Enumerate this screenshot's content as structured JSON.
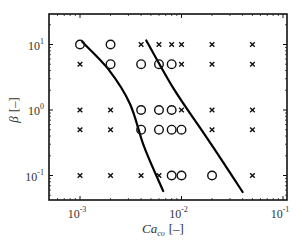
{
  "chart_data": {
    "type": "scatter",
    "title": "",
    "xlabel": "Ca_co [-]",
    "xlabel_main": "Ca",
    "xlabel_sub": "co",
    "xlabel_unit": "[–]",
    "ylabel": "β [-]",
    "ylabel_symbol": "β",
    "ylabel_unit": "[–]",
    "xscale": "log",
    "yscale": "log",
    "xlim": [
      0.0007,
      0.1
    ],
    "ylim": [
      0.05,
      30
    ],
    "xticks": [
      {
        "value": 0.001,
        "base": "10",
        "exp": "-3"
      },
      {
        "value": 0.01,
        "base": "10",
        "exp": "-2"
      },
      {
        "value": 0.1,
        "base": "10",
        "exp": "-1"
      }
    ],
    "yticks": [
      {
        "value": 0.1,
        "base": "10",
        "exp": "-1"
      },
      {
        "value": 1,
        "base": "10",
        "exp": "0"
      },
      {
        "value": 10,
        "base": "10",
        "exp": "1"
      }
    ],
    "grid": false,
    "legend": null,
    "series": [
      {
        "name": "circles",
        "marker": "o",
        "points": [
          [
            0.001,
            10
          ],
          [
            0.002,
            10
          ],
          [
            0.002,
            5
          ],
          [
            0.004,
            5
          ],
          [
            0.006,
            5
          ],
          [
            0.008,
            5
          ],
          [
            0.004,
            1
          ],
          [
            0.006,
            1
          ],
          [
            0.008,
            1
          ],
          [
            0.004,
            0.5
          ],
          [
            0.006,
            0.5
          ],
          [
            0.008,
            0.5
          ],
          [
            0.01,
            0.5
          ],
          [
            0.008,
            0.1
          ],
          [
            0.01,
            0.1
          ],
          [
            0.02,
            0.1
          ]
        ]
      },
      {
        "name": "crosses",
        "marker": "x",
        "points": [
          [
            0.004,
            10
          ],
          [
            0.006,
            10
          ],
          [
            0.008,
            10
          ],
          [
            0.01,
            10
          ],
          [
            0.02,
            10
          ],
          [
            0.05,
            10
          ],
          [
            0.001,
            5
          ],
          [
            0.01,
            5
          ],
          [
            0.02,
            5
          ],
          [
            0.05,
            5
          ],
          [
            0.001,
            1
          ],
          [
            0.002,
            1
          ],
          [
            0.01,
            1
          ],
          [
            0.02,
            1
          ],
          [
            0.05,
            1
          ],
          [
            0.001,
            0.5
          ],
          [
            0.002,
            0.5
          ],
          [
            0.02,
            0.5
          ],
          [
            0.05,
            0.5
          ],
          [
            0.001,
            0.1
          ],
          [
            0.002,
            0.1
          ],
          [
            0.004,
            0.1
          ],
          [
            0.006,
            0.1
          ],
          [
            0.05,
            0.1
          ]
        ]
      }
    ],
    "curves": [
      {
        "name": "boundary-left",
        "points": [
          [
            0.00105,
            11
          ],
          [
            0.0019,
            4.2
          ],
          [
            0.0031,
            1.25
          ],
          [
            0.0043,
            0.27
          ],
          [
            0.0066,
            0.058
          ]
        ]
      },
      {
        "name": "boundary-right",
        "points": [
          [
            0.0045,
            11.5
          ],
          [
            0.0084,
            2.1
          ],
          [
            0.016,
            0.48
          ],
          [
            0.025,
            0.17
          ],
          [
            0.04,
            0.056
          ]
        ]
      }
    ]
  }
}
